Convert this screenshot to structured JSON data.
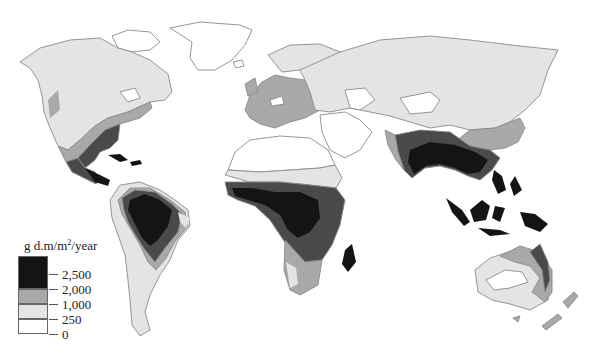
{
  "map": {
    "title": "World net primary productivity",
    "projection": "world outline map",
    "legend": {
      "unit_prefix": "g d.m/m",
      "unit_exponent": "2",
      "unit_suffix": "/year",
      "breaks": [
        "2,500",
        "2,000",
        "1,000",
        "250",
        "0"
      ],
      "classes": [
        {
          "range": "0–250",
          "color": "#ffffff"
        },
        {
          "range": "250–1,000",
          "color": "#e4e4e4"
        },
        {
          "range": "1,000–2,000",
          "color": "#a9a9a9"
        },
        {
          "range": "2,000–2,500",
          "color": "#4a4a4a"
        },
        {
          "range": ">2,500",
          "color": "#141414"
        }
      ]
    },
    "regions": [
      {
        "name": "North America",
        "classes": [
          "0–250",
          "250–1,000",
          "1,000–2,000",
          "2,000–2,500"
        ]
      },
      {
        "name": "Central America & Caribbean",
        "classes": [
          "2,000–2,500",
          ">2,500"
        ]
      },
      {
        "name": "South America",
        "classes": [
          "0–250",
          "250–1,000",
          "1,000–2,000",
          "2,000–2,500",
          ">2,500"
        ]
      },
      {
        "name": "Europe",
        "classes": [
          "250–1,000",
          "1,000–2,000"
        ]
      },
      {
        "name": "Africa",
        "classes": [
          "0–250",
          "250–1,000",
          "1,000–2,000",
          "2,000–2,500",
          ">2,500"
        ]
      },
      {
        "name": "Asia",
        "classes": [
          "0–250",
          "250–1,000",
          "1,000–2,000",
          "2,000–2,500",
          ">2,500"
        ]
      },
      {
        "name": "Southeast Asia & Indonesia",
        "classes": [
          ">2,500"
        ]
      },
      {
        "name": "Australia",
        "classes": [
          "0–250",
          "250–1,000",
          "1,000–2,000",
          "2,000–2,500"
        ]
      },
      {
        "name": "New Zealand",
        "classes": [
          "1,000–2,000"
        ]
      },
      {
        "name": "Greenland & Arctic islands",
        "classes": [
          "0–250"
        ]
      }
    ]
  }
}
